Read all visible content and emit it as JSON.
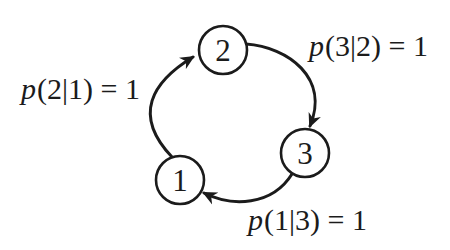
{
  "diagram": {
    "type": "state-transition-cycle",
    "colors": {
      "ink": "#1b1b1b",
      "background": "#ffffff",
      "node_fill": "#ffffff"
    },
    "nodes": [
      {
        "id": "1",
        "label": "1"
      },
      {
        "id": "2",
        "label": "2"
      },
      {
        "id": "3",
        "label": "3"
      }
    ],
    "edges": [
      {
        "from": "1",
        "to": "2",
        "func": "p",
        "expr": "(2|1) = 1",
        "full": "p(2|1) = 1"
      },
      {
        "from": "2",
        "to": "3",
        "func": "p",
        "expr": "(3|2) = 1",
        "full": "p(3|2) = 1"
      },
      {
        "from": "3",
        "to": "1",
        "func": "p",
        "expr": "(1|3) = 1",
        "full": "p(1|3) = 1"
      }
    ]
  }
}
